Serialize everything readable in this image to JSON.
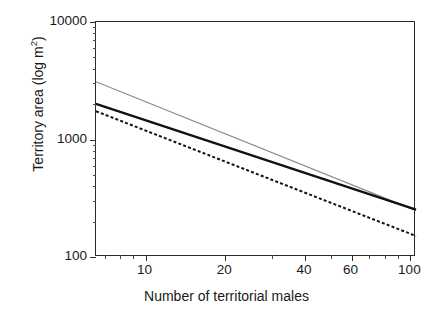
{
  "chart_data": {
    "type": "line",
    "title": "",
    "subtitle": "",
    "xlabel": "Number of territorial males",
    "ylabel": "Territory area (log m²)",
    "ylabel_prefix": "Territory area (log m",
    "ylabel_suffix": ")",
    "ylabel_exponent": "2",
    "xscale": "log",
    "yscale": "log",
    "xlim": [
      6.5,
      105
    ],
    "ylim": [
      100,
      10000
    ],
    "grid": false,
    "legend": "none",
    "x_tick_labels": [
      "10",
      "20",
      "40",
      "60",
      "100"
    ],
    "x_tick_values": [
      10,
      20,
      40,
      60,
      100
    ],
    "x_minor_ticks": [
      7,
      8,
      9,
      30,
      50,
      70,
      80,
      90
    ],
    "y_tick_labels": [
      "100",
      "1000",
      "10000"
    ],
    "y_tick_values": [
      100,
      1000,
      10000
    ],
    "series": [
      {
        "name": "upper-gray-line",
        "style": "solid",
        "color": "#8c8c8c",
        "width": 1.2,
        "x": [
          6.5,
          105
        ],
        "values": [
          3100,
          248
        ]
      },
      {
        "name": "middle-black-line",
        "style": "solid",
        "color": "#111111",
        "width": 2.3,
        "x": [
          6.5,
          105
        ],
        "values": [
          2010,
          253
        ]
      },
      {
        "name": "lower-dashed-line",
        "style": "dashed",
        "color": "#111111",
        "width": 2.0,
        "dash": "3,2.2",
        "x": [
          6.5,
          105
        ],
        "values": [
          1740,
          151
        ]
      }
    ]
  }
}
